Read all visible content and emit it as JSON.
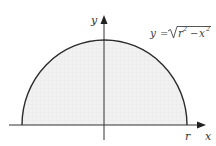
{
  "diagram": {
    "type": "semicircle-region",
    "equation": {
      "lhs": "y",
      "equals": "=",
      "radicand_r": "r",
      "radicand_exp1": "2",
      "minus": "−",
      "radicand_x": "x",
      "radicand_exp2": "2",
      "full": "y = √(r² − x²)"
    },
    "axes": {
      "x_label": "x",
      "y_label": "y"
    },
    "tick_labels": {
      "r_label": "r"
    },
    "colors": {
      "curve": "#2b2b2b",
      "axis": "#333333",
      "fill": "#eeeeee"
    }
  }
}
